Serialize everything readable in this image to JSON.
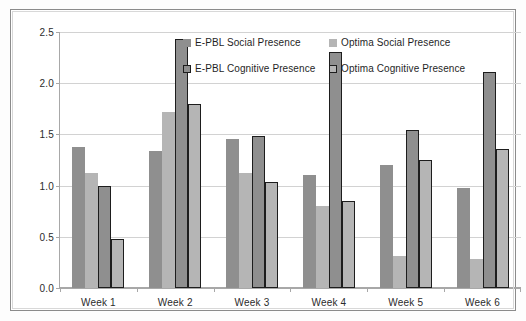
{
  "chart_data": {
    "type": "bar",
    "title": "",
    "xlabel": "",
    "ylabel": "",
    "ylim": [
      0.0,
      2.5
    ],
    "yticks": [
      "0.0",
      "0.5",
      "1.0",
      "1.5",
      "2.0",
      "2.5"
    ],
    "ytick_values": [
      0.0,
      0.5,
      1.0,
      1.5,
      2.0,
      2.5
    ],
    "grid": true,
    "legend_position": "inside-top-center",
    "categories": [
      "Week 1",
      "Week 2",
      "Week 3",
      "Week 4",
      "Week 5",
      "Week 6"
    ],
    "series": [
      {
        "name": "E-PBL Social Presence",
        "color": "#8f8f8f",
        "border": "none",
        "values": [
          1.38,
          1.34,
          1.46,
          1.1,
          1.2,
          0.98
        ]
      },
      {
        "name": "Optima Social Presence",
        "color": "#b5b5b5",
        "border": "none",
        "values": [
          1.12,
          1.72,
          1.12,
          0.8,
          0.31,
          0.28
        ]
      },
      {
        "name": "E-PBL Cognitive Presence",
        "color": "#8f8f8f",
        "border": "#1d1d1d",
        "values": [
          1.0,
          2.43,
          1.48,
          2.3,
          1.54,
          2.11
        ]
      },
      {
        "name": "Optima Cognitive Presence",
        "color": "#b5b5b5",
        "border": "#1d1d1d",
        "values": [
          0.48,
          1.8,
          1.04,
          0.85,
          1.25,
          1.36
        ]
      }
    ]
  }
}
